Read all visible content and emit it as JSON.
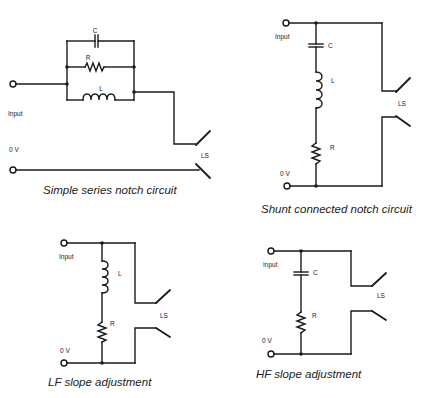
{
  "diagrams": {
    "series_notch": {
      "caption": "Simple series notch circuit",
      "labels": {
        "c": "C",
        "r": "R",
        "l": "L",
        "input": "Input",
        "zero_v": "0 V",
        "ls": "LS"
      }
    },
    "shunt_notch": {
      "caption": "Shunt connected notch circuit",
      "labels": {
        "input": "Input",
        "c": "C",
        "l": "L",
        "r": "R",
        "zero_v": "0 V",
        "ls": "LS"
      }
    },
    "lf_slope": {
      "caption": "LF slope adjustment",
      "labels": {
        "input": "Input",
        "l": "L",
        "r": "R",
        "zero_v": "0 V",
        "ls": "LS"
      }
    },
    "hf_slope": {
      "caption": "HF slope adjustment",
      "labels": {
        "input": "Input",
        "c": "C",
        "r": "R",
        "zero_v": "0 V",
        "ls": "LS"
      }
    }
  }
}
